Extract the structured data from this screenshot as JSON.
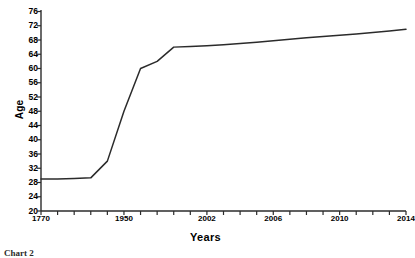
{
  "chart_data": {
    "type": "line",
    "title": "",
    "xlabel": "Years",
    "ylabel": "Age",
    "ylim": [
      20,
      76
    ],
    "ytick_step": 4,
    "yticks": [
      20,
      24,
      28,
      32,
      36,
      40,
      44,
      48,
      52,
      56,
      60,
      64,
      68,
      72,
      76
    ],
    "xtick_labels": [
      "1770",
      "1950",
      "2002",
      "2006",
      "2010",
      "2014"
    ],
    "xtick_count": 23,
    "grid": false,
    "legend": null,
    "series": [
      {
        "name": "Age",
        "color": "#2b2b2b",
        "x": [
          0,
          1,
          2,
          3,
          4,
          5,
          6,
          7,
          8,
          9,
          10,
          11,
          12,
          13,
          14,
          15,
          16,
          17,
          18,
          19,
          20,
          21,
          22
        ],
        "x_labels": [
          "1770",
          "",
          "",
          "",
          "",
          "1950",
          "",
          "",
          "",
          "",
          "2002",
          "",
          "",
          "",
          "2006",
          "",
          "",
          "",
          "2010",
          "",
          "",
          "",
          "2014"
        ],
        "values": [
          29,
          29,
          29.1,
          29.3,
          34,
          48,
          60,
          62,
          66,
          66.2,
          66.4,
          66.7,
          67,
          67.4,
          67.8,
          68.2,
          68.6,
          69,
          69.3,
          69.7,
          70.1,
          70.5,
          71
        ]
      }
    ]
  },
  "axes": {
    "y_title": "Age",
    "x_title": "Years"
  },
  "caption": {
    "text": "Chart 2"
  }
}
